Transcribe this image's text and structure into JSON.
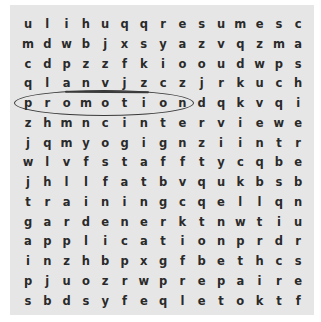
{
  "puzzle": {
    "rows": [
      [
        "u",
        "l",
        "i",
        "h",
        "u",
        "q",
        "q",
        "r",
        "e",
        "s",
        "u",
        "m",
        "e",
        "s",
        "c"
      ],
      [
        "m",
        "d",
        "w",
        "b",
        "j",
        "x",
        "s",
        "y",
        "a",
        "z",
        "v",
        "q",
        "z",
        "m",
        "a"
      ],
      [
        "c",
        "d",
        "p",
        "z",
        "z",
        "f",
        "k",
        "i",
        "o",
        "o",
        "u",
        "d",
        "w",
        "p",
        "s"
      ],
      [
        "q",
        "l",
        "a",
        "n",
        "v",
        "j",
        "z",
        "c",
        "z",
        "j",
        "r",
        "k",
        "u",
        "c",
        "h"
      ],
      [
        "p",
        "r",
        "o",
        "m",
        "o",
        "t",
        "i",
        "o",
        "n",
        "d",
        "q",
        "k",
        "v",
        "q",
        "i"
      ],
      [
        "z",
        "h",
        "m",
        "n",
        "c",
        "i",
        "n",
        "t",
        "e",
        "r",
        "v",
        "i",
        "e",
        "w",
        "e"
      ],
      [
        "j",
        "q",
        "m",
        "y",
        "o",
        "g",
        "i",
        "g",
        "n",
        "z",
        "i",
        "i",
        "n",
        "t",
        "r"
      ],
      [
        "w",
        "l",
        "v",
        "f",
        "s",
        "t",
        "a",
        "f",
        "f",
        "t",
        "y",
        "c",
        "q",
        "b",
        "e"
      ],
      [
        "j",
        "h",
        "l",
        "l",
        "f",
        "a",
        "t",
        "b",
        "v",
        "q",
        "u",
        "k",
        "b",
        "s",
        "b"
      ],
      [
        "t",
        "r",
        "a",
        "i",
        "n",
        "i",
        "n",
        "g",
        "c",
        "q",
        "e",
        "l",
        "l",
        "q",
        "n"
      ],
      [
        "g",
        "a",
        "r",
        "d",
        "e",
        "n",
        "e",
        "r",
        "k",
        "t",
        "n",
        "w",
        "t",
        "i",
        "u"
      ],
      [
        "a",
        "p",
        "p",
        "l",
        "i",
        "c",
        "a",
        "t",
        "i",
        "o",
        "n",
        "p",
        "r",
        "d",
        "r"
      ],
      [
        "i",
        "n",
        "z",
        "h",
        "b",
        "p",
        "x",
        "g",
        "f",
        "b",
        "e",
        "t",
        "h",
        "c",
        "s"
      ],
      [
        "p",
        "j",
        "u",
        "o",
        "z",
        "r",
        "w",
        "p",
        "r",
        "e",
        "p",
        "a",
        "i",
        "r",
        "e"
      ],
      [
        "s",
        "b",
        "d",
        "s",
        "y",
        "f",
        "e",
        "q",
        "l",
        "e",
        "t",
        "o",
        "k",
        "t",
        "f"
      ]
    ],
    "found_words": [
      {
        "word": "promotion",
        "row": 4,
        "col_start": 0,
        "col_end": 8,
        "mark": "circle"
      }
    ],
    "partial_marks": [
      {
        "row": 3,
        "col_start": 2,
        "col_end": 6,
        "mark": "underline"
      }
    ],
    "colors": {
      "board_bg": "#e6e6e6",
      "letter": "#2a2a2a",
      "pen": "#3a3a3a"
    }
  }
}
